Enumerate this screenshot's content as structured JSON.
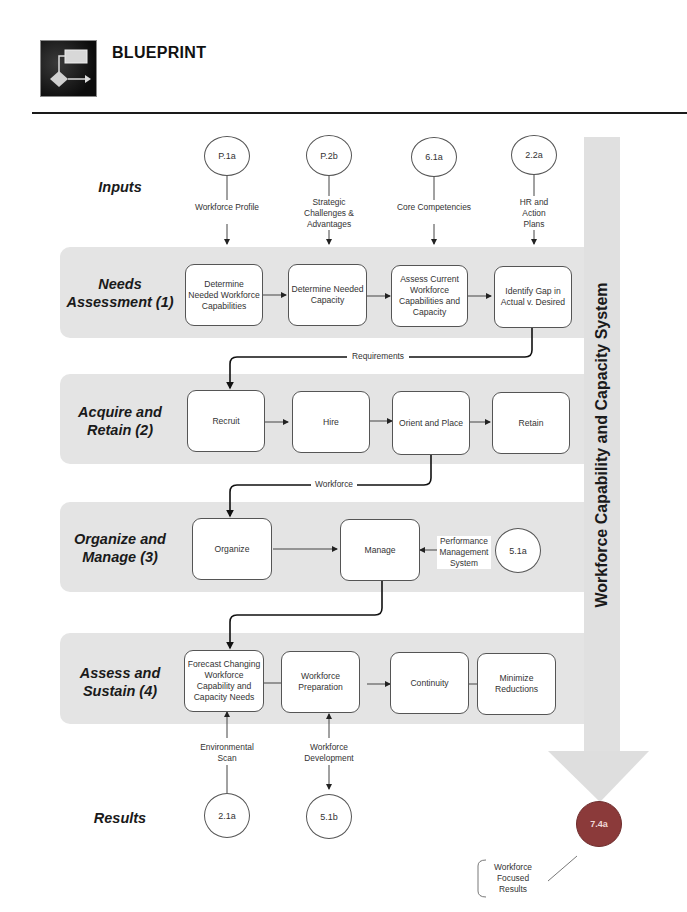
{
  "header": {
    "title": "BLUEPRINT",
    "logo_icon": "flowchart-icon"
  },
  "side_bar": {
    "label": "Workforce Capability and Capacity System",
    "color": "#e0e0e0"
  },
  "rows": {
    "inputs": {
      "label": "Inputs"
    },
    "results": {
      "label": "Results"
    }
  },
  "inputs": [
    {
      "ref": "P.1a",
      "label": "Workforce Profile"
    },
    {
      "ref": "P.2b",
      "label": "Strategic Challenges & Advantages"
    },
    {
      "ref": "6.1a",
      "label": "Core Competencies"
    },
    {
      "ref": "2.2a",
      "label": "HR and Action Plans"
    }
  ],
  "sections": [
    {
      "label": "Needs Assessment (1)",
      "steps": [
        "Determine Needed Workforce Capabilities",
        "Determine Needed Capacity",
        "Assess Current Workforce Capabilities and Capacity",
        "Identify Gap in Actual v. Desired"
      ]
    },
    {
      "label": "Acquire and Retain (2)",
      "steps": [
        "Recruit",
        "Hire",
        "Orient and Place",
        "Retain"
      ]
    },
    {
      "label": "Organize and Manage (3)",
      "steps": [
        "Organize",
        "Manage"
      ],
      "side_input": {
        "ref": "5.1a",
        "label": "Performance Management System"
      }
    },
    {
      "label": "Assess and Sustain (4)",
      "steps": [
        "Forecast Changing Workforce Capability and Capacity Needs",
        "Workforce Preparation",
        "Continuity",
        "Minimize Reductions"
      ]
    }
  ],
  "connectors": {
    "c1": "Requirements",
    "c2": "Workforce"
  },
  "results": [
    {
      "ref": "2.1a",
      "label": "Environmental Scan"
    },
    {
      "ref": "5.1b",
      "label": "Workforce Development"
    }
  ],
  "final_result": {
    "ref": "7.4a",
    "label": "Workforce Focused Results",
    "color": "#8b3a3a"
  }
}
